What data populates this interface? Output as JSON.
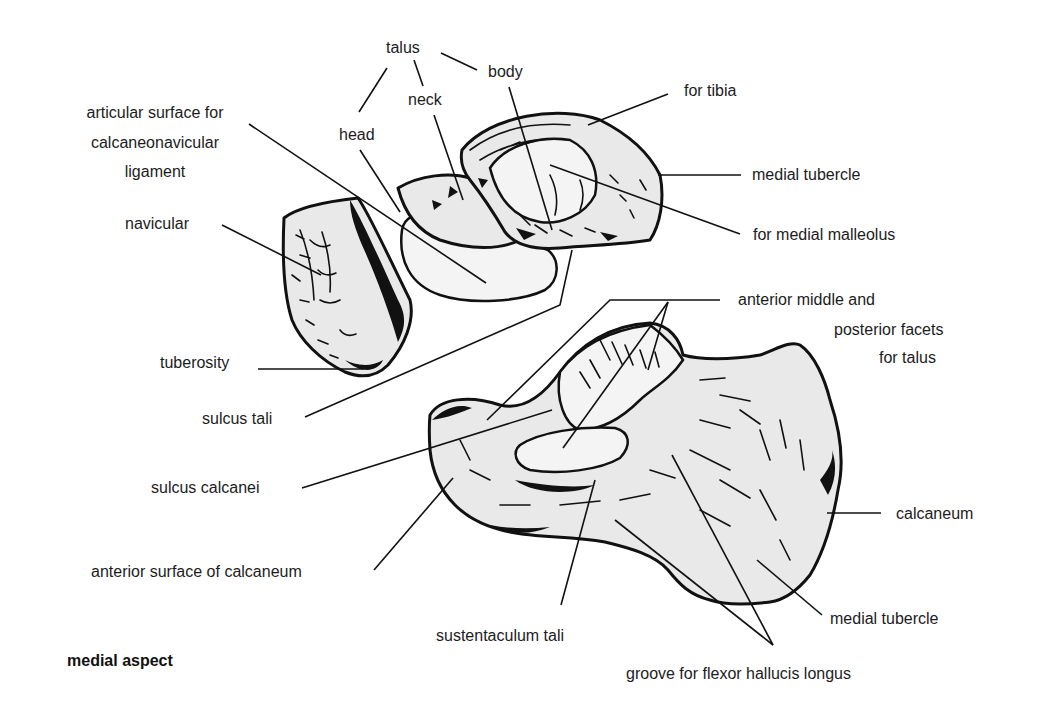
{
  "figure": {
    "view": "medial aspect",
    "bones": [
      "talus",
      "navicular",
      "calcaneum"
    ]
  },
  "labels": {
    "talus": "talus",
    "talus_body": "body",
    "talus_neck": "neck",
    "talus_head": "head",
    "articular_surface_line1": "articular surface for",
    "articular_surface_line2": "calcaneonavicular",
    "articular_surface_line3": "ligament",
    "for_tibia": "for tibia",
    "medial_tubercle_talus": "medial tubercle",
    "for_medial_malleolus": "for medial malleolus",
    "navicular": "navicular",
    "tuberosity": "tuberosity",
    "sulcus_tali": "sulcus tali",
    "facets_line1": "anterior middle and",
    "facets_line2": "posterior facets",
    "facets_line3": "for talus",
    "sulcus_calcanei": "sulcus calcanei",
    "calcaneum": "calcaneum",
    "anterior_surface_calcaneum": "anterior surface of calcaneum",
    "medial_tubercle_calcaneum": "medial tubercle",
    "sustentaculum_tali": "sustentaculum tali",
    "groove_fhl": "groove for flexor hallucis longus"
  },
  "caption": "medial aspect"
}
